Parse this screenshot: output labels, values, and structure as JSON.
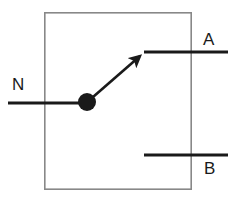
{
  "diagram": {
    "type": "electrical-schematic",
    "background_color": "#ffffff",
    "enclosure": {
      "name": "switch-enclosure",
      "shape": "rectangle",
      "stroke_color": "#888888",
      "stroke_width": 1.6,
      "x": 44,
      "y": 12,
      "width": 148,
      "height": 178
    },
    "wire_color": "#1a1a1a",
    "wire_width": 3,
    "labels": {
      "common": "N",
      "contact_top": "A",
      "contact_bottom": "B"
    },
    "terminals": [
      {
        "id": "common",
        "label": "N",
        "role": "common-pole",
        "wire": {
          "x1": 8,
          "y1": 103,
          "x2": 87,
          "y2": 103
        },
        "label_x": 12,
        "label_y": 76
      },
      {
        "id": "contact-a",
        "label": "A",
        "role": "normally-open-contact",
        "wire": {
          "x1": 144,
          "y1": 52,
          "x2": 228,
          "y2": 52
        },
        "label_x": 203,
        "label_y": 31
      },
      {
        "id": "contact-b",
        "label": "B",
        "role": "normally-closed-contact",
        "wire": {
          "x1": 144,
          "y1": 155,
          "x2": 228,
          "y2": 155
        },
        "label_x": 204,
        "label_y": 160
      }
    ],
    "pivot": {
      "name": "switch-pivot-dot",
      "cx": 87,
      "cy": 102,
      "r": 9,
      "fill": "#1a1a1a"
    },
    "blade": {
      "name": "switch-blade-arrow",
      "from_x": 93,
      "from_y": 97,
      "to_x": 143,
      "to_y": 53,
      "state": "closed-to-A",
      "arrowhead": true
    }
  }
}
